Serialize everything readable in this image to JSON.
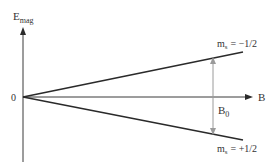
{
  "diagram": {
    "y_axis": {
      "label_main": "E",
      "label_sub": "mag"
    },
    "x_axis": {
      "label": "B"
    },
    "origin_label": "0",
    "upper_line": {
      "label_m": "m",
      "label_sub": "s",
      "label_value": "= −1/2"
    },
    "lower_line": {
      "label_m": "m",
      "label_sub": "s",
      "label_value": "= +1/2"
    },
    "splitting": {
      "label_main": "B",
      "label_sub": "0"
    },
    "colors": {
      "axis": "#3a3a3a",
      "lines": "#2a2a2a",
      "splitting_arrow": "#9a9a9a",
      "text": "#333333"
    }
  }
}
